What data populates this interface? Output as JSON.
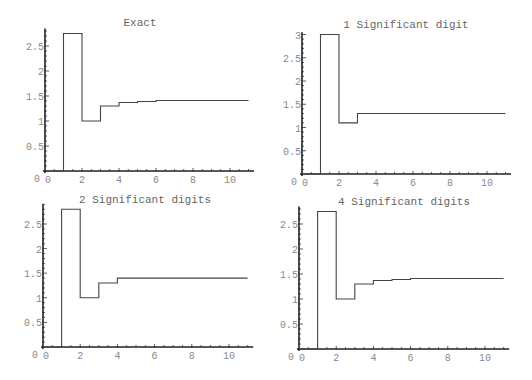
{
  "chart_data": [
    {
      "type": "line",
      "style": "step",
      "title": "Exact",
      "xlabel": "",
      "ylabel": "",
      "x_ticks": [
        0,
        2,
        4,
        6,
        8,
        10
      ],
      "y_ticks": [
        0.5,
        1,
        1.5,
        2,
        2.5
      ],
      "y_tick_labels": [
        "0.5",
        "1",
        "1.5",
        "2",
        "2.5"
      ],
      "origin_label": "0",
      "xlim": [
        0,
        11.3
      ],
      "ylim": [
        0,
        2.85
      ],
      "steps": [
        {
          "x0": 0,
          "x1": 1,
          "y": 0
        },
        {
          "x0": 1,
          "x1": 2,
          "y": 2.75
        },
        {
          "x0": 2,
          "x1": 3,
          "y": 1.0
        },
        {
          "x0": 3,
          "x1": 4,
          "y": 1.3
        },
        {
          "x0": 4,
          "x1": 5,
          "y": 1.37
        },
        {
          "x0": 5,
          "x1": 6,
          "y": 1.39
        },
        {
          "x0": 6,
          "x1": 11,
          "y": 1.41
        }
      ],
      "grid": false,
      "legend": "none",
      "layout": {
        "left": 0,
        "top": 0,
        "w": 266,
        "h": 190,
        "ox": 45,
        "oy": 171,
        "px_per_x": 18.5,
        "px_per_y": 50,
        "title_x": 140,
        "title_y": 26
      }
    },
    {
      "type": "line",
      "style": "step",
      "title": "1 Significant digit",
      "xlabel": "",
      "ylabel": "",
      "x_ticks": [
        0,
        2,
        4,
        6,
        8,
        10
      ],
      "y_ticks": [
        0.5,
        1,
        1.5,
        2,
        2.5,
        3
      ],
      "y_tick_labels": [
        "0.5",
        "1",
        "1.5",
        "2",
        "2.5",
        "3"
      ],
      "origin_label": "0",
      "xlim": [
        0,
        11.3
      ],
      "ylim": [
        0,
        3.05
      ],
      "steps": [
        {
          "x0": 0,
          "x1": 1,
          "y": 0
        },
        {
          "x0": 1,
          "x1": 2,
          "y": 3.0
        },
        {
          "x0": 2,
          "x1": 3,
          "y": 1.1
        },
        {
          "x0": 3,
          "x1": 11,
          "y": 1.3
        }
      ],
      "grid": false,
      "legend": "none",
      "layout": {
        "left": 266,
        "top": 0,
        "w": 266,
        "h": 190,
        "ox": 36,
        "oy": 174,
        "px_per_x": 18.5,
        "px_per_y": 46.5,
        "title_x": 140,
        "title_y": 28
      }
    },
    {
      "type": "line",
      "style": "step",
      "title": "2 Significant digits",
      "xlabel": "",
      "ylabel": "",
      "x_ticks": [
        0,
        2,
        4,
        6,
        8,
        10
      ],
      "y_ticks": [
        0.5,
        1,
        1.5,
        2,
        2.5
      ],
      "y_tick_labels": [
        "0.5",
        "1",
        "1.5",
        "2",
        "2.5"
      ],
      "origin_label": "0",
      "xlim": [
        0,
        11.3
      ],
      "ylim": [
        0,
        2.9
      ],
      "steps": [
        {
          "x0": 0,
          "x1": 1,
          "y": 0
        },
        {
          "x0": 1,
          "x1": 2,
          "y": 2.8
        },
        {
          "x0": 2,
          "x1": 3,
          "y": 1.0
        },
        {
          "x0": 3,
          "x1": 4,
          "y": 1.3
        },
        {
          "x0": 4,
          "x1": 5,
          "y": 1.4
        },
        {
          "x0": 5,
          "x1": 11,
          "y": 1.4
        }
      ],
      "grid": false,
      "legend": "none",
      "layout": {
        "left": 0,
        "top": 190,
        "w": 266,
        "h": 190,
        "ox": 43,
        "oy": 157,
        "px_per_x": 18.6,
        "px_per_y": 49.2,
        "title_x": 145,
        "title_y": 13
      }
    },
    {
      "type": "line",
      "style": "step",
      "title": "4 Significant digits",
      "xlabel": "",
      "ylabel": "",
      "x_ticks": [
        0,
        2,
        4,
        6,
        8,
        10
      ],
      "y_ticks": [
        0.5,
        1,
        1.5,
        2,
        2.5
      ],
      "y_tick_labels": [
        "0.5",
        "1",
        "1.5",
        "2",
        "2.5"
      ],
      "origin_label": "0",
      "xlim": [
        0,
        11.3
      ],
      "ylim": [
        0,
        2.85
      ],
      "steps": [
        {
          "x0": 0,
          "x1": 1,
          "y": 0
        },
        {
          "x0": 1,
          "x1": 2,
          "y": 2.75
        },
        {
          "x0": 2,
          "x1": 3,
          "y": 1.0
        },
        {
          "x0": 3,
          "x1": 4,
          "y": 1.3
        },
        {
          "x0": 4,
          "x1": 5,
          "y": 1.37
        },
        {
          "x0": 5,
          "x1": 6,
          "y": 1.39
        },
        {
          "x0": 6,
          "x1": 11,
          "y": 1.41
        }
      ],
      "grid": false,
      "legend": "none",
      "layout": {
        "left": 266,
        "top": 190,
        "w": 266,
        "h": 190,
        "ox": 33,
        "oy": 159,
        "px_per_x": 18.6,
        "px_per_y": 50,
        "title_x": 138,
        "title_y": 15
      }
    }
  ]
}
